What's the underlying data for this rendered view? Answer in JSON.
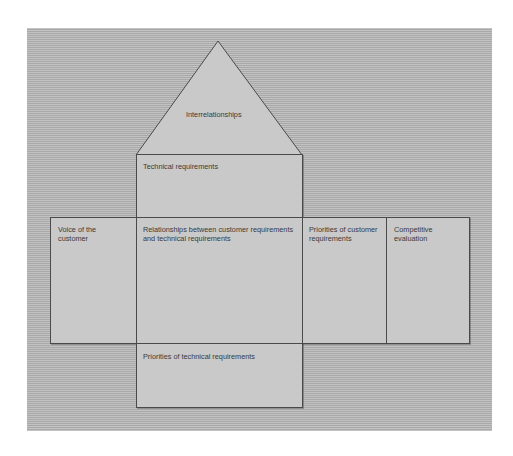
{
  "diagram": {
    "type": "house-of-quality",
    "roof": {
      "label": "Interrelationships"
    },
    "ceiling": {
      "label": "Technical requirements"
    },
    "left_wall": {
      "label": "Voice of the customer"
    },
    "center": {
      "label": "Relationships between customer requirements and technical requirements"
    },
    "right_col_1": {
      "label": "Priorities of customer requirements"
    },
    "right_col_2": {
      "label": "Competitive evaluation"
    },
    "basement": {
      "label": "Priorities of technical requirements"
    }
  },
  "colors": {
    "background_panel": "#b4b4b4",
    "box_fill": "#c9c9c9",
    "border": "#4a4a4a",
    "text": "#3a3a3a"
  }
}
